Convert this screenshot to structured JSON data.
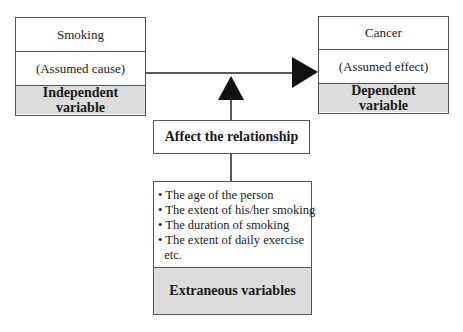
{
  "cause_box": {
    "variable": "Smoking",
    "role": "(Assumed cause)",
    "type_line1": "Independent",
    "type_line2": "variable"
  },
  "effect_box": {
    "variable": "Cancer",
    "role": "(Assumed effect)",
    "type_line1": "Dependent",
    "type_line2": "variable"
  },
  "relationship_label": "Affect the relationship",
  "extraneous_box": {
    "items": [
      "• The age of the person",
      "• The extent of his/her smoking",
      "• The duration of smoking",
      "• The extent of daily exercise",
      "  etc."
    ],
    "title": "Extraneous variables"
  },
  "colors": {
    "gray_fill": "#dcdcdc",
    "line": "#222222",
    "border": "#555555"
  }
}
